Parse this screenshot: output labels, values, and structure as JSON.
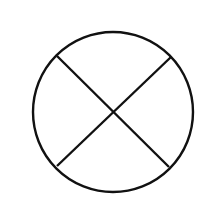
{
  "diagram": {
    "background": "#ffffff",
    "stroke_color": "#111111",
    "circle": {
      "cx": 113,
      "cy": 112,
      "r": 80
    },
    "lines": [
      {
        "x1": 57,
        "y1": 56,
        "x2": 169,
        "y2": 167
      },
      {
        "x1": 171,
        "y1": 57,
        "x2": 57,
        "y2": 166
      }
    ]
  }
}
